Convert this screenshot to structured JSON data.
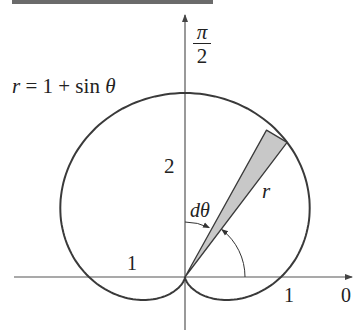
{
  "figure": {
    "equation": {
      "lhs": "r",
      "eq": " = 1 + sin ",
      "theta": "θ"
    },
    "labels": {
      "pi_over_2_num": "π",
      "pi_over_2_den": "2",
      "two": "2",
      "d_theta": "dθ",
      "r": "r",
      "one_left": "1",
      "one_right": "1",
      "zero": "0"
    },
    "colors": {
      "curve": "#3a3a3a",
      "axis": "#555555",
      "wedge_fill": "#c8c8c8",
      "wedge_stroke": "#3a3a3a",
      "top_bar": "#6b6b6b"
    }
  },
  "chart_data": {
    "type": "polar-curve",
    "title": "",
    "curve": {
      "equation": "r = 1 + sin θ",
      "theta_range": [
        0,
        6.283185
      ],
      "samples": 240
    },
    "origin_px": [
      185,
      277
    ],
    "scale_px": {
      "x": 96,
      "y": 92
    },
    "axes": {
      "horizontal": {
        "from_x": 14,
        "to_x": 352,
        "arrow": "right",
        "end_label": "0"
      },
      "vertical": {
        "from_y": 330,
        "to_y": 15,
        "arrow": "up",
        "end_label": "π/2"
      }
    },
    "wedge": {
      "theta_deg": 54,
      "dtheta_deg": 8,
      "r": 1.809
    },
    "theta_arc": {
      "radius_px": 60,
      "from_deg": 0,
      "to_deg": 52,
      "arrow": "end"
    },
    "dtheta_arc": {
      "radius_px": 55,
      "from_deg": 90,
      "to_deg": 64,
      "arrow": "end"
    },
    "annotations": [
      "r = 1 + sin θ",
      "π/2",
      "2",
      "dθ",
      "r",
      "1",
      "1",
      "0"
    ]
  }
}
